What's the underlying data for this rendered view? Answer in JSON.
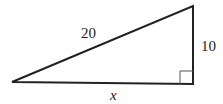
{
  "diagram": {
    "type": "right-triangle",
    "labels": {
      "hypotenuse": "20",
      "vertical_leg": "10",
      "horizontal_leg": "x"
    },
    "right_angle_marker": true,
    "stroke_color": "#222222"
  }
}
